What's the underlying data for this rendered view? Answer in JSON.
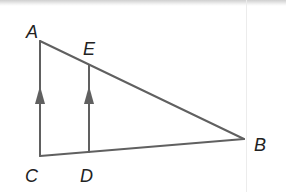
{
  "diagram": {
    "type": "geometry-triangle",
    "points": {
      "A": "A",
      "B": "B",
      "C": "C",
      "D": "D",
      "E": "E"
    },
    "segments": [
      "AC",
      "AB",
      "CB",
      "ED"
    ],
    "parallel_marks": [
      "AC",
      "ED"
    ],
    "line_color": "#606060",
    "label_color": "#222222"
  }
}
